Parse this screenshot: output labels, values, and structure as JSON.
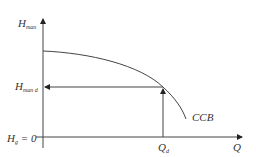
{
  "diagram": {
    "type": "pump characteristic curve",
    "colors": {
      "line": "#444444",
      "text": "#333333",
      "background": "#ffffff"
    },
    "y_axis": {
      "label_main": "H",
      "label_sub": "man"
    },
    "x_axis": {
      "label_main": "Q",
      "label_sub": ""
    },
    "origin_label": {
      "label_main": "H",
      "label_sub": "g",
      "suffix": " = 0"
    },
    "operating_head": {
      "label_main": "H",
      "label_sub": "man d"
    },
    "operating_flow": {
      "label_main": "Q",
      "label_sub": "d"
    },
    "curve_label": "CCB"
  }
}
